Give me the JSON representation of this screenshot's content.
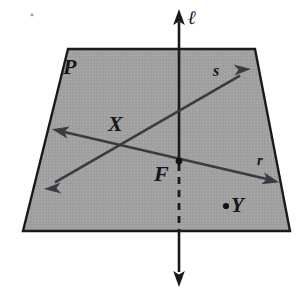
{
  "figure": {
    "kind": "geometry-diagram",
    "background_color": "#ffffff",
    "plane": {
      "name": "P",
      "label": "P",
      "fill_color": "#a2a2a2",
      "edge_color": "#1a1a1a",
      "corners": [
        {
          "x": 68,
          "y": 49
        },
        {
          "x": 255,
          "y": 49
        },
        {
          "x": 290,
          "y": 231
        },
        {
          "x": 23,
          "y": 231
        }
      ]
    },
    "lines": [
      {
        "name": "l",
        "label": "ℓ",
        "color": "#1a1a1a",
        "style": "solid-above-and-below-dashed-inside",
        "from": {
          "x": 179,
          "y": 12
        },
        "to": {
          "x": 179,
          "y": 284
        },
        "pierce_point": {
          "x": 179,
          "y": 161
        },
        "exit_point": {
          "x": 179,
          "y": 231
        },
        "arrow_start": true,
        "arrow_end": true
      },
      {
        "name": "r",
        "label": "r",
        "color": "#3a3a42",
        "style": "solid",
        "from": {
          "x": 55,
          "y": 130
        },
        "to": {
          "x": 276,
          "y": 181
        },
        "arrow_start": true,
        "arrow_end": true
      },
      {
        "name": "s",
        "label": "s",
        "color": "#3a3a42",
        "style": "solid",
        "from": {
          "x": 47,
          "y": 187
        },
        "to": {
          "x": 248,
          "y": 71
        },
        "arrow_start": true,
        "arrow_end": true
      }
    ],
    "points": [
      {
        "name": "F",
        "label": "F",
        "x": 179,
        "y": 161,
        "dot": true,
        "note": "line l pierces plane P at F"
      },
      {
        "name": "X",
        "label": "X",
        "x": 120,
        "y": 148,
        "dot": false,
        "note": "intersection of lines r and s"
      },
      {
        "name": "Y",
        "label": "Y",
        "x": 226,
        "y": 206,
        "dot": true,
        "note": "point in plane P"
      }
    ],
    "labels": {
      "plane": "P",
      "point_x": "X",
      "point_f": "F",
      "point_y": "Y",
      "line_s": "s",
      "line_r": "r",
      "line_ell": "ℓ"
    }
  }
}
